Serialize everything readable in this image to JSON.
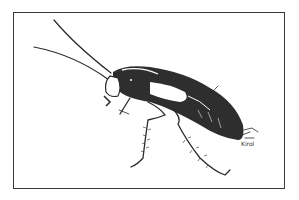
{
  "illustration": {
    "subject": "cockroach",
    "style": "black-and-white ink drawing",
    "signature": "Kirol",
    "colors": {
      "ink": "#2a2a2a",
      "background": "#ffffff",
      "frame": "#3a3a3a"
    }
  }
}
